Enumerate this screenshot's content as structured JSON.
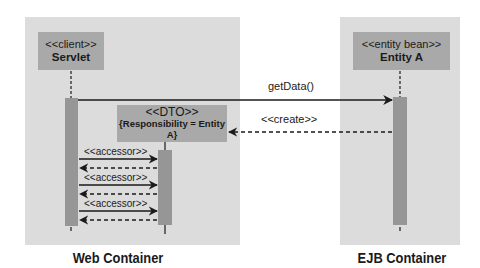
{
  "diagram": {
    "type": "uml-sequence",
    "containers": [
      {
        "id": "web",
        "label": "Web Container",
        "color": "#dcdcdc"
      },
      {
        "id": "ejb",
        "label": "EJB Container",
        "color": "#dcdcdc"
      }
    ],
    "participants": {
      "servlet": {
        "stereotype": "<<client>>",
        "name": "Servlet",
        "container": "web"
      },
      "dto": {
        "stereotype": "<<DTO>>",
        "note": "{Responsibility = Entity A}",
        "container": "web"
      },
      "entity": {
        "stereotype": "<<entity bean>>",
        "name": "Entity A",
        "container": "ejb"
      }
    },
    "messages": [
      {
        "from": "servlet",
        "to": "entity",
        "label": "getData()",
        "style": "solid"
      },
      {
        "from": "entity",
        "to": "dto",
        "label": "<<create>>",
        "style": "dashed"
      },
      {
        "from": "servlet",
        "to": "dto",
        "label": "<<accessor>>",
        "style": "solid"
      },
      {
        "from": "dto",
        "to": "servlet",
        "label": "",
        "style": "dashed"
      },
      {
        "from": "servlet",
        "to": "dto",
        "label": "<<accessor>>",
        "style": "solid"
      },
      {
        "from": "dto",
        "to": "servlet",
        "label": "",
        "style": "dashed"
      },
      {
        "from": "servlet",
        "to": "dto",
        "label": "<<accessor>>",
        "style": "solid"
      },
      {
        "from": "dto",
        "to": "servlet",
        "label": "",
        "style": "dashed"
      }
    ],
    "colors": {
      "container_bg": "#dcdcdc",
      "object_box": "#a9a9a9",
      "activation_bar": "#969696",
      "line": "#1a1a1a"
    }
  }
}
